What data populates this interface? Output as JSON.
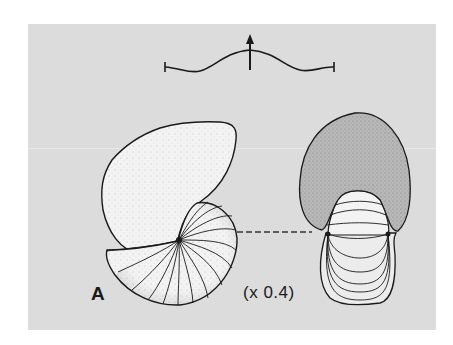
{
  "figure": {
    "panel_label": "A",
    "scale_label": "(x 0.4)",
    "colors": {
      "background": "#dcdcdc",
      "ink": "#1a1a1a",
      "shell_light": "#f2f2f2",
      "shell_shaded": "#b4b4b4"
    },
    "elements": {
      "suture_diagram": "suture-line-with-arrow",
      "side_view": "nautilus-shell-lateral-view",
      "front_view": "nautilus-shell-apertural-view",
      "connector": "dashed-line"
    }
  }
}
